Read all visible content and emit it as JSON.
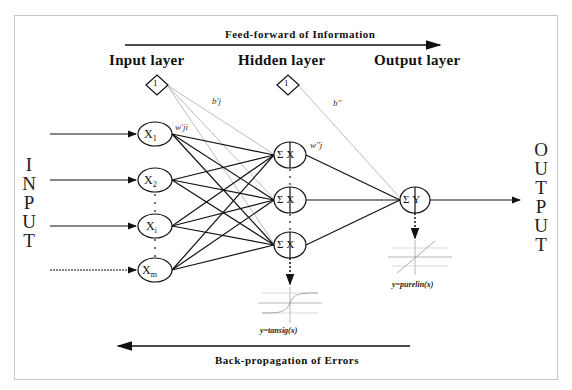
{
  "diagram": {
    "type": "neural-network-architecture",
    "feed_forward_label": "Feed-forward of Information",
    "back_propagation_label": "Back-propagation of Errors",
    "layers": [
      {
        "label": "Input layer"
      },
      {
        "label": "Hidden layer"
      },
      {
        "label": "Output layer"
      }
    ],
    "input_side_label": "INPUT",
    "output_side_label": "OUTPUT",
    "input_nodes": [
      {
        "label": "X",
        "sub": "1"
      },
      {
        "label": "X",
        "sub": "2"
      },
      {
        "label": "X",
        "sub": "i"
      },
      {
        "label": "X",
        "sub": "m"
      }
    ],
    "hidden_nodes": [
      {
        "sum": "Σ",
        "label": "X",
        "sub": "j"
      },
      {
        "sum": "Σ",
        "label": "X",
        "sub": "j"
      },
      {
        "sum": "Σ",
        "label": "X",
        "sub": "j"
      }
    ],
    "output_node": {
      "sum": "Σ",
      "label": "Y"
    },
    "bias_nodes": [
      {
        "label": "1",
        "layer": "input"
      },
      {
        "label": "1",
        "layer": "hidden"
      }
    ],
    "weights": {
      "input_hidden": "w'ji",
      "hidden_output": "w''j",
      "bias_hidden": "b'j",
      "bias_output": "b''"
    },
    "activation_functions": {
      "hidden": "y=tansig(x)",
      "output": "y=purelin(x)"
    }
  }
}
